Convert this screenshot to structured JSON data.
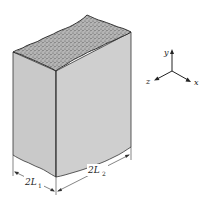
{
  "figure": {
    "colors": {
      "face": "#c9c9c9",
      "face_right": "#cfcfcf",
      "top_texture": "#9a9a9a",
      "outline": "#333333",
      "background": "#ffffff"
    },
    "dimensions": {
      "width_label": "2L",
      "width_sub": "1",
      "depth_label": "2L",
      "depth_sub": "2"
    },
    "axes": {
      "y_label": "y",
      "x_label": "x",
      "z_label": "z"
    }
  }
}
